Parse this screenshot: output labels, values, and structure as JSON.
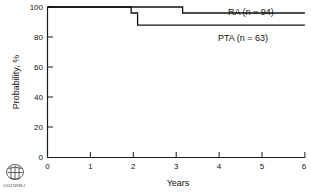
{
  "chart_data": {
    "type": "line",
    "title": "",
    "subtitle": "",
    "xlabel": "Years",
    "ylabel": "Probability, %",
    "xlim": [
      0,
      6
    ],
    "ylim": [
      0,
      100
    ],
    "grid": false,
    "legend_position": "inline-right",
    "x_ticks": [
      "0",
      "1",
      "2",
      "3",
      "4",
      "5",
      "6"
    ],
    "x_tick_values": [
      0,
      1,
      2,
      3,
      4,
      5,
      6
    ],
    "y_ticks": [
      "0",
      "20",
      "40",
      "60",
      "80",
      "100"
    ],
    "y_tick_values": [
      0,
      20,
      40,
      60,
      80,
      100
    ],
    "step_style": "post",
    "series": [
      {
        "name": "RA",
        "label": "RA (n = 94)",
        "n": 94,
        "color": "#111111",
        "x": [
          0,
          3.15,
          6
        ],
        "y": [
          100,
          100,
          96
        ],
        "steps": [
          {
            "x": 0,
            "y": 100
          },
          {
            "x": 3.15,
            "y": 100
          },
          {
            "x": 3.15,
            "y": 96
          },
          {
            "x": 6,
            "y": 96
          }
        ]
      },
      {
        "name": "PTA",
        "label": "PTA (n = 63)",
        "n": 63,
        "color": "#111111",
        "x": [
          0,
          1.95,
          2.1,
          6
        ],
        "y": [
          100,
          96,
          88,
          88
        ],
        "steps": [
          {
            "x": 0,
            "y": 100
          },
          {
            "x": 1.95,
            "y": 100
          },
          {
            "x": 1.95,
            "y": 96
          },
          {
            "x": 2.1,
            "y": 96
          },
          {
            "x": 2.1,
            "y": 88
          },
          {
            "x": 6,
            "y": 88
          }
        ]
      }
    ]
  },
  "axes": {
    "y_label": "Probability, %",
    "x_label": "Years",
    "y_tick_labels": [
      "100",
      "80",
      "60",
      "40",
      "20",
      "0"
    ],
    "x_tick_labels": [
      "0",
      "1",
      "2",
      "3",
      "4",
      "5",
      "6"
    ]
  },
  "legend": {
    "ra_label": "RA (n = 94)",
    "pta_label": "PTA (n = 63)"
  },
  "footer": {
    "credit_code": "CG1274938-2",
    "logo_name": "institutional-seal"
  },
  "colors": {
    "line": "#111111",
    "axis": "#1a1a1a",
    "text": "#111111",
    "background": "#ffffff"
  }
}
